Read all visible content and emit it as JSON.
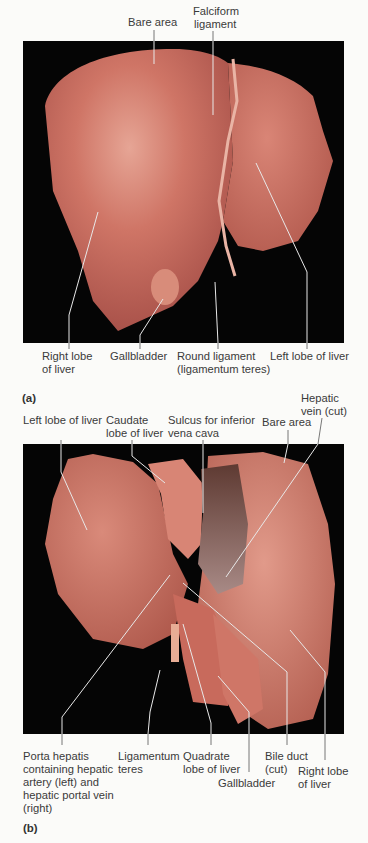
{
  "figure": {
    "panel_a": {
      "tag": "(a)",
      "top_labels": {
        "bare_area": "Bare area",
        "falciform_1": "Falciform",
        "falciform_2": "ligament"
      },
      "bottom_labels": {
        "right_lobe_1": "Right lobe",
        "right_lobe_2": "of liver",
        "gallbladder": "Gallbladder",
        "round_ligament_1": "Round ligament",
        "round_ligament_2": "(ligamentum teres)",
        "left_lobe": "Left lobe of liver"
      }
    },
    "panel_b": {
      "tag": "(b)",
      "top_labels": {
        "left_lobe": "Left lobe of liver",
        "caudate_1": "Caudate",
        "caudate_2": "lobe of liver",
        "sulcus_1": "Sulcus for inferior",
        "sulcus_2": "vena cava",
        "bare_area": "Bare area",
        "hepatic_vein_1": "Hepatic",
        "hepatic_vein_2": "vein (cut)"
      },
      "bottom_labels": {
        "porta_1": "Porta hepatis",
        "porta_2": "containing hepatic",
        "porta_3": "artery (left) and",
        "porta_4": "hepatic portal vein",
        "porta_5": "(right)",
        "ligamentum_1": "Ligamentum",
        "ligamentum_2": "teres",
        "quadrate_1": "Quadrate",
        "quadrate_2": "lobe of liver",
        "gallbladder": "Gallbladder",
        "bile_duct_1": "Bile duct",
        "bile_duct_2": "(cut)",
        "right_lobe_1": "Right lobe",
        "right_lobe_2": "of liver"
      }
    },
    "colors": {
      "background": "#fbfbf9",
      "photo_bg": "#050505",
      "liver": "#c8675a",
      "liver_light": "#e49b8c",
      "liver_dark": "#9e4a40",
      "leader_line": "#e8e8e8"
    }
  }
}
